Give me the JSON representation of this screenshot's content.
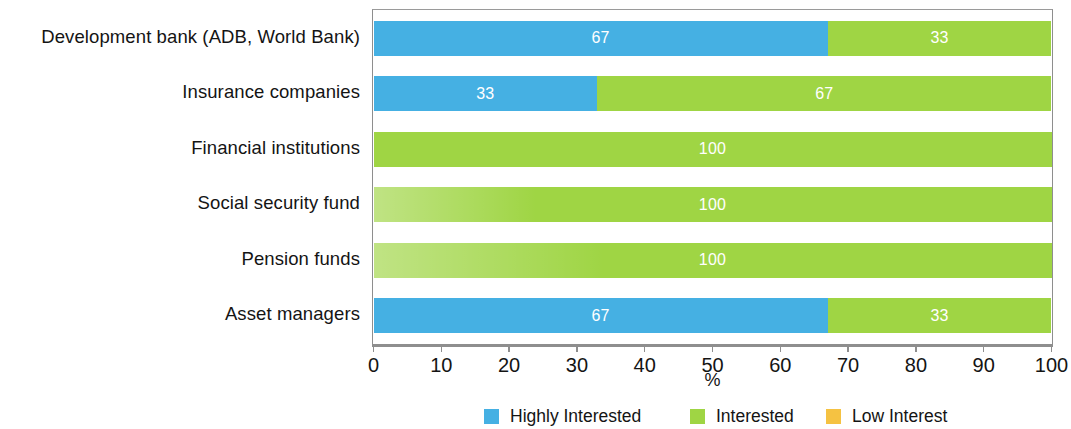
{
  "chart_data": {
    "type": "bar",
    "orientation": "horizontal",
    "stacked": true,
    "stack_total": 100,
    "title": "",
    "subtitle": "",
    "xlabel": "%",
    "ylabel": "",
    "xlim": [
      0,
      100
    ],
    "xticks": [
      0,
      10,
      20,
      30,
      40,
      50,
      60,
      70,
      80,
      90,
      100
    ],
    "xtick_labels": [
      "0",
      "10",
      "20",
      "30",
      "40",
      "50",
      "60",
      "70",
      "80",
      "90",
      "100"
    ],
    "grid": false,
    "legend_position": "bottom",
    "categories": [
      "Development bank (ADB, World Bank)",
      "Insurance companies",
      "Financial institutions",
      "Social security fund",
      "Pension funds",
      "Asset managers"
    ],
    "series": [
      {
        "name": "Highly Interested",
        "color": "#45b0e3",
        "values": [
          67,
          33,
          0,
          0,
          0,
          67
        ],
        "labels": [
          "67",
          "33",
          "",
          "",
          "",
          "67"
        ]
      },
      {
        "name": "Interested",
        "color": "#9fd544",
        "values": [
          33,
          67,
          100,
          100,
          100,
          33
        ],
        "labels": [
          "33",
          "67",
          "100",
          "100",
          "100",
          "33"
        ]
      },
      {
        "name": "Low Interest",
        "color": "#f5c242",
        "values": [
          0,
          0,
          0,
          0,
          0,
          0
        ],
        "labels": [
          "",
          "",
          "",
          "",
          "",
          ""
        ]
      }
    ]
  },
  "legend": {
    "items": [
      {
        "label": "Highly Interested",
        "color": "#45b0e3"
      },
      {
        "label": "Interested",
        "color": "#9fd544"
      },
      {
        "label": "Low Interest",
        "color": "#f5c242"
      }
    ]
  },
  "axis": {
    "x_title": "%"
  },
  "colors": {
    "highly_interested": "#45b0e3",
    "interested": "#9fd544",
    "low_interest": "#f5c242",
    "frame": "#8e8e8e",
    "text": "#141414",
    "value_label": "#ffffff"
  }
}
